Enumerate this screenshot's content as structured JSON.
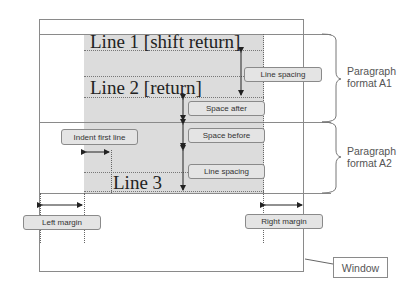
{
  "diagram": {
    "lines": {
      "line1": "Line 1 [shift return]",
      "line2": "Line 2 [return]",
      "line3": "Line 3"
    },
    "labels": {
      "line_spacing_1": "Line spacing",
      "space_after": "Space after",
      "space_before": "Space before",
      "line_spacing_2": "Line spacing",
      "indent_first_line": "Indent first line",
      "left_margin": "Left margin",
      "right_margin": "Right margin",
      "window": "Window"
    },
    "brackets": {
      "paragraph_a1_line1": "Paragraph",
      "paragraph_a1_line2": "format A1",
      "paragraph_a2_line1": "Paragraph",
      "paragraph_a2_line2": "format A2"
    },
    "colors": {
      "page_area": "#dcdcdc",
      "frame": "#8a8a8a",
      "label_fill": "#e4e4e4"
    }
  }
}
